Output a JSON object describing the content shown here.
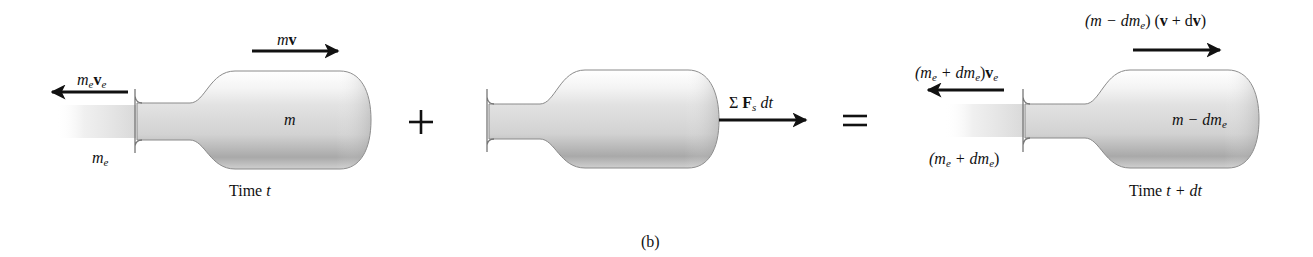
{
  "figure": {
    "caption": "(b)",
    "type": "rocket variable-mass impulse-momentum diagram"
  },
  "panels": [
    {
      "id": "state-time-t",
      "time_label": "Time t",
      "body_mass_label": "m",
      "momentum_label": "mv",
      "exhaust_momentum_label": "m_e v_e",
      "exhaust_mass_label": "m_e"
    },
    {
      "id": "impulse",
      "force_impulse_label": "Σ F_s dt"
    },
    {
      "id": "state-time-t-plus-dt",
      "time_label": "Time t + dt",
      "body_mass_label": "m − dm_e",
      "momentum_label": "(m − dm_e) (v + dv)",
      "exhaust_momentum_label": "(m_e + dm_e)v_e",
      "exhaust_mass_label": "(m_e + dm_e)"
    }
  ],
  "operators": {
    "plus": "+",
    "equals": "="
  },
  "text": {
    "time_t_word": "Time",
    "time_t_var": "t",
    "time_tdt_word": "Time",
    "time_tdt_expr": "t + dt",
    "m": "m",
    "mv_m": "m",
    "mv_v": "v",
    "meve_m": "m",
    "meve_v": "v",
    "sub_e": "e",
    "sub_s": "s",
    "sigma": "Σ",
    "F": "F",
    "dt": "dt",
    "m_minus": "m − dm",
    "top_left_paren": "(m − dm",
    "top_right": ") (",
    "v": "v",
    "plus_d": " + d",
    "close_paren": ")",
    "left_open": "(m",
    "plus_dm": " + dm",
    "close_v": ")",
    "caption": "(b)"
  }
}
